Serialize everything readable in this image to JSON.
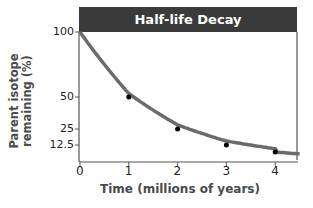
{
  "chart_data": {
    "type": "line",
    "title": "Half-life Decay",
    "xlabel": "Time (millions of years)",
    "ylabel": "Parent isotope remaining (%)",
    "x_ticks": [
      "0",
      "1",
      "2",
      "3",
      "4"
    ],
    "y_ticks": [
      "100",
      "50",
      "25",
      "12.5"
    ],
    "xlim": [
      0,
      4.5
    ],
    "ylim": [
      0,
      100
    ],
    "grid": false,
    "legend": null,
    "series": [
      {
        "name": "Parent isotope remaining",
        "x": [
          0,
          1,
          2,
          3,
          4
        ],
        "values": [
          100,
          50,
          25,
          12.5,
          6.25
        ],
        "marked_points": [
          [
            1,
            50
          ],
          [
            2,
            25
          ],
          [
            3,
            12.5
          ],
          [
            4,
            6.25
          ]
        ]
      }
    ],
    "colors": {
      "curve": "#6b6b6b",
      "points": "#000000",
      "title_bar": "#3a3a3a"
    }
  }
}
